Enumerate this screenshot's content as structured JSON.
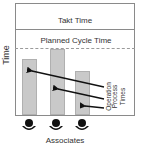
{
  "diagram": {
    "y_axis_label": "Time",
    "x_axis_label": "Associates",
    "takt_time_label": "Takt Time",
    "planned_cycle_time_label": "Planned Cycle Time",
    "operation_process_times_label": [
      "Operation",
      "Process",
      "Times"
    ],
    "bar_color": "#c9c9c9",
    "line_color": "#8a8a8a",
    "bars": [
      {
        "name": "associate-1",
        "relative_height": 0.84
      },
      {
        "name": "associate-2",
        "relative_height": 0.98
      },
      {
        "name": "associate-3",
        "relative_height": 0.66
      }
    ],
    "associates": [
      {
        "icon": "person-icon"
      },
      {
        "icon": "person-icon"
      },
      {
        "icon": "person-icon"
      }
    ]
  }
}
